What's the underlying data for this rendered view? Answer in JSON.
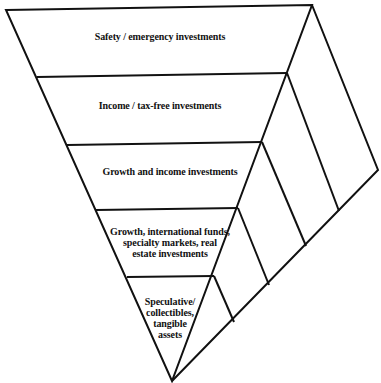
{
  "diagram": {
    "type": "inverted-pyramid",
    "line_color": "#111111",
    "background": "#ffffff",
    "tiers": [
      {
        "label": "Safety / emergency investments"
      },
      {
        "label": "Income / tax-free investments"
      },
      {
        "label": "Growth and income investments"
      },
      {
        "label": "Growth, international funds,\nspecialty markets, real\nestate investments"
      },
      {
        "label": "Speculative/\ncollectibles,\ntangible\nassets"
      }
    ]
  }
}
